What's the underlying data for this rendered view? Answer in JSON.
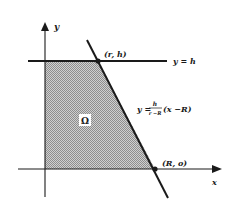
{
  "figure": {
    "axes": {
      "x_label": "x",
      "y_label": "y"
    },
    "region": {
      "label": "Ω",
      "fill": "#b8b8b8"
    },
    "lines": {
      "horizontal": {
        "label": "y = h"
      },
      "slanted": {
        "label_prefix": "y =",
        "fraction_num": "h",
        "fraction_den": "r −R",
        "label_suffix": "(x −R)"
      }
    },
    "points": [
      {
        "label": "(r, h)"
      },
      {
        "label": "(R, o)"
      }
    ],
    "colors": {
      "ink": "#1a1a1a",
      "shading": "#b8b8b8",
      "background": "#ffffff"
    }
  }
}
